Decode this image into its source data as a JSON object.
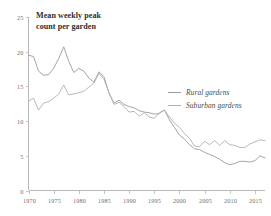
{
  "chart_data": {
    "type": "line",
    "title": "Mean weekly peak count per garden",
    "title_line1": "Mean weekly peak",
    "title_line2": "count per garden",
    "xlabel": "",
    "ylabel": "",
    "xlim": [
      1970,
      2017
    ],
    "ylim": [
      0,
      25
    ],
    "grid": false,
    "legend_position": "center-right",
    "xticks": [
      1970,
      1975,
      1980,
      1985,
      1990,
      1995,
      2000,
      2005,
      2010,
      2015
    ],
    "xtick_labels": [
      "1970",
      "1975",
      "1980",
      "1985",
      "1990",
      "1995",
      "2000",
      "2005",
      "2010",
      "2015"
    ],
    "yticks": [
      0,
      5,
      10,
      15,
      20,
      25
    ],
    "ytick_labels": [
      "0",
      "5",
      "10",
      "15",
      "20",
      "25"
    ],
    "x": [
      1970,
      1971,
      1972,
      1973,
      1974,
      1975,
      1976,
      1977,
      1978,
      1979,
      1980,
      1981,
      1982,
      1983,
      1984,
      1985,
      1986,
      1987,
      1988,
      1989,
      1990,
      1991,
      1992,
      1993,
      1994,
      1995,
      1996,
      1997,
      1998,
      1999,
      2000,
      2001,
      2002,
      2003,
      2004,
      2005,
      2006,
      2007,
      2008,
      2009,
      2010,
      2011,
      2012,
      2013,
      2014,
      2015,
      2016,
      2017
    ],
    "series": [
      {
        "name": "Rural gardens",
        "color": "#9a9a9a",
        "values": [
          19.5,
          19.3,
          17.2,
          16.6,
          16.7,
          17.6,
          19.0,
          20.7,
          18.6,
          17.0,
          17.6,
          17.2,
          16.2,
          15.6,
          17.1,
          16.4,
          14.0,
          12.6,
          13.0,
          12.4,
          12.1,
          11.9,
          11.5,
          11.3,
          11.2,
          11.0,
          11.1,
          11.6,
          10.2,
          9.1,
          8.0,
          7.4,
          6.6,
          6.0,
          5.9,
          5.5,
          5.2,
          4.9,
          4.5,
          4.0,
          3.7,
          3.9,
          4.2,
          4.2,
          4.1,
          4.3,
          5.0,
          4.7
        ]
      },
      {
        "name": "Suburban gardens",
        "color": "#b0b0b0",
        "values": [
          12.9,
          13.3,
          11.6,
          12.6,
          12.8,
          13.3,
          13.9,
          15.2,
          13.8,
          13.9,
          14.1,
          14.3,
          14.9,
          15.5,
          16.9,
          16.0,
          14.1,
          12.4,
          12.7,
          12.1,
          11.3,
          11.4,
          10.7,
          11.2,
          10.6,
          10.4,
          11.2,
          11.6,
          10.6,
          9.7,
          9.1,
          8.2,
          7.5,
          6.4,
          6.3,
          7.1,
          6.6,
          7.2,
          6.5,
          7.2,
          6.6,
          6.5,
          6.2,
          6.2,
          6.7,
          7.0,
          7.3,
          7.2
        ]
      }
    ]
  },
  "legend": {
    "items": [
      {
        "label": "Rural gardens",
        "color": "#9a9a9a"
      },
      {
        "label": "Suburban gardens",
        "color": "#b0b0b0"
      }
    ]
  }
}
